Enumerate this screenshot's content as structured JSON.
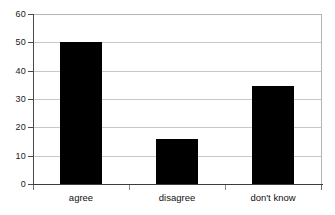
{
  "chart_data": {
    "type": "bar",
    "title": "",
    "subtitle": "",
    "xlabel": "",
    "ylabel": "",
    "categories": [
      "agree",
      "disagree",
      "don't know"
    ],
    "values": [
      50,
      16,
      34.5
    ],
    "series": [
      {
        "name": "responses",
        "values": [
          50,
          16,
          34.5
        ]
      }
    ],
    "ylim": [
      0,
      60
    ],
    "yticks": [
      0,
      10,
      20,
      30,
      40,
      50,
      60
    ],
    "ytick_labels": [
      "0",
      "10",
      "20",
      "30",
      "40",
      "50",
      "60"
    ],
    "grid": true,
    "grid_axis": "y",
    "legend": false,
    "legend_position": "none",
    "bar_color": "#000000",
    "grid_color": "#c8c8c8",
    "axis_color": "#3c3c3c",
    "background_color": "#ffffff"
  }
}
